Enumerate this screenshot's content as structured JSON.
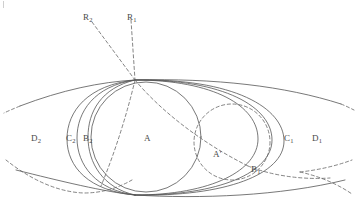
{
  "figure": {
    "background_color": "#ffffff",
    "stroke_color": "#555555",
    "dash_color": "#666666",
    "label_color": "#4a4a4a"
  },
  "labels": {
    "ray_2": "R",
    "ray_2_sub": "2",
    "ray_1": "R",
    "ray_1_sub": "1",
    "region_D2": "D",
    "region_D2_sub": "2",
    "region_C2": "C",
    "region_C2_sub": "2",
    "region_B2": "B",
    "region_B2_sub": "2",
    "region_A": "A",
    "region_A_prime": "A",
    "region_A_prime_mark": "'",
    "region_B1": "B",
    "region_B1_sub": "1",
    "region_C1": "C",
    "region_C1_sub": "1",
    "region_D1": "D",
    "region_D1_sub": "1"
  },
  "geometry": {
    "top_vertex": [
      135,
      80
    ],
    "bottom_vertex": [
      135,
      195
    ],
    "circle_A": {
      "cx": 146,
      "cy": 137,
      "r": 55,
      "style": "solid"
    },
    "circle_A_prime": {
      "cx": 232,
      "cy": 142,
      "r": 38,
      "style": "dashed"
    },
    "rays": [
      {
        "name": "R2",
        "from": [
          135,
          80
        ],
        "to": [
          92,
          22
        ],
        "style": "dashed"
      },
      {
        "name": "R1",
        "from": [
          135,
          80
        ],
        "to": [
          131,
          20
        ],
        "style": "dashed"
      }
    ]
  }
}
